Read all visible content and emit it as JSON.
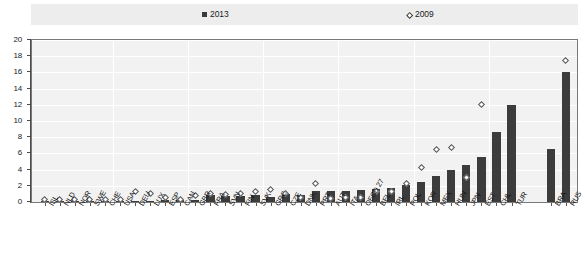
{
  "legend": {
    "series": [
      {
        "label": "2013",
        "marker": "filled-square",
        "color": "#3a3a3a"
      },
      {
        "label": "2009",
        "marker": "open-diamond",
        "color": "#555555"
      }
    ]
  },
  "axis": {
    "y_ticks": [
      "0",
      "2",
      "4",
      "6",
      "8",
      "10",
      "12",
      "14",
      "16",
      "18",
      "20"
    ]
  },
  "chart_data": {
    "type": "bar",
    "title": "",
    "subtitle": "",
    "xlabel": "",
    "ylabel": "",
    "ylim": [
      0,
      20
    ],
    "ytick_step": 2,
    "grid": true,
    "legend_position": "top",
    "categories": [
      "ISL",
      "NLD",
      "NOR",
      "SWE",
      "CHE",
      "USA",
      "DEU",
      "LUX",
      "ESP",
      "CAN",
      "GBR",
      "FRA",
      "SVN",
      "FIN",
      "SVK",
      "GRC",
      "CZE",
      "DNK",
      "PRT",
      "AUT",
      "ITA",
      "OECD 27",
      "BEL",
      "IRL",
      "POL",
      "KOR",
      "MEX",
      "HUN",
      "JPN",
      "EST",
      "CHL",
      "TUR",
      "BRA",
      "RUS"
    ],
    "series": [
      {
        "name": "2013",
        "marker": "bar",
        "values": [
          0.05,
          0.05,
          0.05,
          0.1,
          0.1,
          0.1,
          0.15,
          0.15,
          0.2,
          0.25,
          0.3,
          0.9,
          0.8,
          0.8,
          0.85,
          0.6,
          1.0,
          0.9,
          1.3,
          1.3,
          1.4,
          1.5,
          1.6,
          1.7,
          2.1,
          2.5,
          3.2,
          4.0,
          4.6,
          5.5,
          8.7,
          12.0,
          6.5,
          16.0
        ]
      },
      {
        "name": "2009",
        "marker": "diamond",
        "values": [
          0.3,
          0.3,
          0.3,
          0.3,
          0.3,
          0.3,
          1.3,
          1.1,
          0.5,
          0.3,
          0.8,
          1.0,
          0.9,
          1.0,
          1.3,
          1.5,
          1.1,
          0.6,
          2.3,
          0.4,
          0.5,
          0.6,
          1.3,
          1.3,
          2.3,
          4.2,
          6.5,
          6.7,
          3.0,
          12.0,
          null,
          null,
          null,
          17.5
        ]
      }
    ]
  }
}
